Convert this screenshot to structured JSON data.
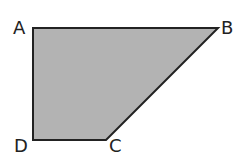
{
  "diagram": {
    "shape": "quadrilateral",
    "fill_color": "#b3b3b3",
    "stroke_color": "#222222",
    "vertices": [
      {
        "label": "A",
        "x": 33,
        "y": 28
      },
      {
        "label": "B",
        "x": 218,
        "y": 28
      },
      {
        "label": "C",
        "x": 106,
        "y": 140
      },
      {
        "label": "D",
        "x": 33,
        "y": 140
      }
    ],
    "labels": {
      "a": "A",
      "b": "B",
      "c": "C",
      "d": "D"
    }
  }
}
